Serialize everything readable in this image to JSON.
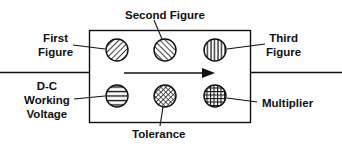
{
  "diagram": {
    "title": "",
    "labels": {
      "first_figure_line1": "First",
      "first_figure_line2": "Figure",
      "second_figure": "Second Figure",
      "third_figure_line1": "Third",
      "third_figure_line2": "Figure",
      "dc_voltage_line1": "D-C",
      "dc_voltage_line2": "Working",
      "dc_voltage_line3": "Voltage",
      "tolerance": "Tolerance",
      "multiplier": "Multiplier"
    },
    "dots": [
      {
        "name": "first-figure",
        "pattern": "diagonal-forward"
      },
      {
        "name": "second-figure",
        "pattern": "diagonal-back"
      },
      {
        "name": "third-figure",
        "pattern": "vertical"
      },
      {
        "name": "dc-working-voltage",
        "pattern": "horizontal"
      },
      {
        "name": "tolerance",
        "pattern": "crosshatch-diagonal"
      },
      {
        "name": "multiplier",
        "pattern": "grid"
      }
    ],
    "arrow_direction": "right",
    "colors": {
      "ink": "#111111",
      "background": "#ffffff"
    }
  }
}
